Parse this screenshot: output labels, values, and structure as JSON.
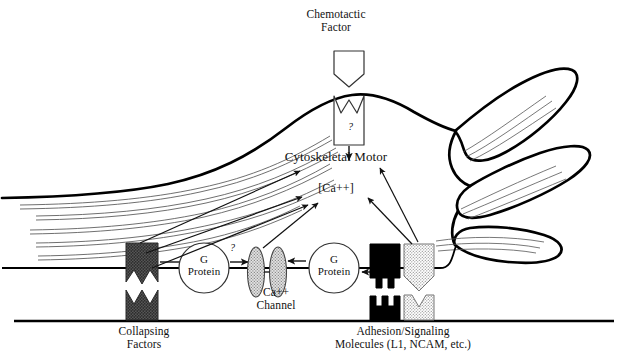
{
  "figure": {
    "type": "biological-schematic"
  },
  "labels": {
    "chemotactic_factor": "Chemotactic\nFactor",
    "cytoskeletal_motor": "Cytoskeletal Motor",
    "calcium": "[Ca++]",
    "g_protein_left": "G\nProtein",
    "g_protein_right": "G\nProtein",
    "ca_channel": "Ca++\nChannel",
    "collapsing_factors": "Collapsing\nFactors",
    "adhesion_molecules": "Adhesion/Signaling\nMolecules (L1, NCAM, etc.)",
    "question_receptor": "?",
    "question_gprotein": "?"
  },
  "elements": {
    "chemotactic_ligand": "pentagon-ligand-shape",
    "chemotactic_receptor": "notched-box-receptor",
    "collapsing_receptor": "dark-hatched-receptor",
    "collapsing_ligand": "dark-hatched-ligand",
    "adhesion_receptor": "black-receptor-with-prongs",
    "adhesion_ligand": "black-ligand-with-prongs",
    "cam_receptor": "stippled-notched-receptor",
    "cam_ligand": "stippled-ligand",
    "calcium_channel_left": "stippled-ellipse",
    "calcium_channel_right": "stippled-ellipse",
    "growth_cone": "lamellipodium-outline",
    "filopodium_1": "filopodium-upper",
    "filopodium_2": "filopodium-middle",
    "filopodium_3": "filopodium-lower",
    "substrate": "substrate-baseline",
    "axon_shaft": "axon-shaft-outline",
    "cytoskeleton": "actin-microtubule-bundles"
  },
  "colors": {
    "ink": "#111111",
    "membrane": "#000000",
    "dark_receptor": "#4a4a4a",
    "black_receptor": "#000000",
    "stipple": "#d8d8d8",
    "channel_fill": "#cfcfcf",
    "background": "#ffffff"
  }
}
